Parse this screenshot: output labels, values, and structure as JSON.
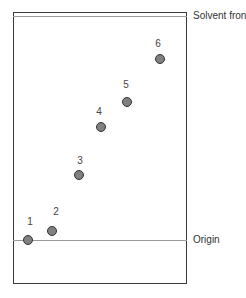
{
  "diagram": {
    "title": "",
    "lines": {
      "solvent_front": {
        "label": "Solvent front",
        "y": 16
      },
      "origin": {
        "label": "Origin",
        "y": 240
      }
    },
    "spots": [
      {
        "id": "1",
        "x": 28,
        "y": 240,
        "label_x": 30,
        "label_y": 221
      },
      {
        "id": "2",
        "x": 52,
        "y": 231,
        "label_x": 56,
        "label_y": 211
      },
      {
        "id": "3",
        "x": 79,
        "y": 175,
        "label_x": 80,
        "label_y": 160
      },
      {
        "id": "4",
        "x": 101,
        "y": 127,
        "label_x": 99,
        "label_y": 111
      },
      {
        "id": "5",
        "x": 127,
        "y": 102,
        "label_x": 126,
        "label_y": 84
      },
      {
        "id": "6",
        "x": 160,
        "y": 59,
        "label_x": 158,
        "label_y": 43
      }
    ],
    "colors": {
      "spot_fill": "#808080",
      "spot_stroke": "#333333",
      "frame": "#3a3a3a",
      "line": "#9a9a9a"
    }
  }
}
